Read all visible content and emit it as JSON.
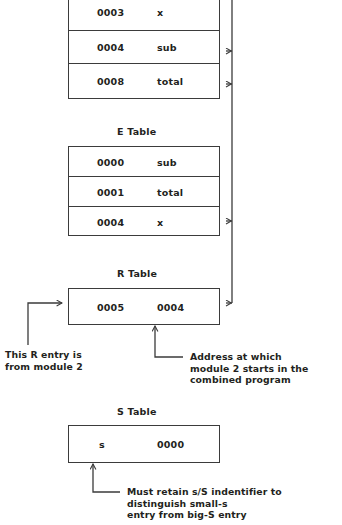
{
  "diagram": {
    "stroke_color": "#3b3b3b",
    "text_color": "#231f20"
  },
  "tables": {
    "top": {
      "label": "",
      "columns": [
        "address",
        "symbol"
      ],
      "rows": [
        {
          "address": "0003",
          "symbol": "x"
        },
        {
          "address": "0004",
          "symbol": "sub"
        },
        {
          "address": "0008",
          "symbol": "total"
        }
      ]
    },
    "e_table": {
      "label": "E Table",
      "columns": [
        "address",
        "symbol"
      ],
      "rows": [
        {
          "address": "0000",
          "symbol": "sub"
        },
        {
          "address": "0001",
          "symbol": "total"
        },
        {
          "address": "0004",
          "symbol": "x"
        }
      ]
    },
    "r_table": {
      "label": "R Table",
      "columns": [
        "address",
        "symbol"
      ],
      "rows": [
        {
          "address": "0005",
          "symbol": "0004"
        }
      ]
    },
    "s_table": {
      "label": "S Table",
      "columns": [
        "address",
        "symbol"
      ],
      "rows": [
        {
          "address": "s",
          "symbol": "0000"
        }
      ]
    }
  },
  "annotations": {
    "r_entry_note": "This R entry is\nfrom module 2",
    "address_note": "Address at which\nmodule 2 starts in the\ncombined program",
    "s_identifier_note": "Must retain s/S indentifier to distinguish small-s\nentry from big-S entry"
  }
}
